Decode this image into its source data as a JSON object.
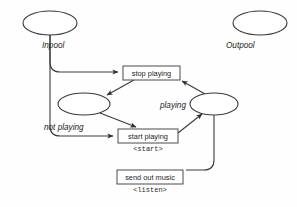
{
  "diagram": {
    "type": "workflow-state-diagram",
    "background_color": "#fefefe",
    "stroke_color": "#3a3a3a",
    "pools": [
      {
        "id": "inpool",
        "label": "Inpool",
        "shape": "ellipse",
        "cx": 50,
        "cy": 23,
        "rx": 27,
        "ry": 12
      },
      {
        "id": "outpool",
        "label": "Outpool",
        "shape": "ellipse",
        "cx": 260,
        "cy": 23,
        "rx": 27,
        "ry": 12
      }
    ],
    "states": [
      {
        "id": "not-playing",
        "label": "not playing",
        "shape": "ellipse",
        "cx": 84,
        "cy": 104,
        "rx": 26,
        "ry": 11
      },
      {
        "id": "playing",
        "label": "playing",
        "shape": "ellipse",
        "cx": 214,
        "cy": 104,
        "rx": 24,
        "ry": 11
      }
    ],
    "actions": [
      {
        "id": "stop-playing",
        "label": "stop playing",
        "sublabel": "",
        "x": 123,
        "y": 66,
        "w": 57,
        "h": 14
      },
      {
        "id": "start-playing",
        "label": "start playing",
        "sublabel": "<start>",
        "x": 118,
        "y": 129,
        "w": 60,
        "h": 14
      },
      {
        "id": "send-out-music",
        "label": "send out music",
        "sublabel": "<listen>",
        "x": 117,
        "y": 170,
        "w": 66,
        "h": 14
      }
    ],
    "edges": [
      {
        "from": "inpool",
        "to": "stop-playing"
      },
      {
        "from": "inpool",
        "to": "start-playing"
      },
      {
        "from": "stop-playing",
        "to": "not-playing"
      },
      {
        "from": "not-playing",
        "to": "start-playing"
      },
      {
        "from": "start-playing",
        "to": "playing"
      },
      {
        "from": "playing",
        "to": "stop-playing"
      },
      {
        "from": "playing",
        "to": "send-out-music"
      }
    ]
  }
}
